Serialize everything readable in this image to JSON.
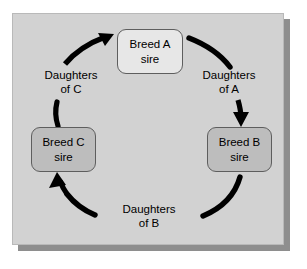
{
  "figure": {
    "panel_background": "#d2d2d2",
    "shadow_color": "#8e8e8e",
    "arrow_color": "#000000"
  },
  "nodes": [
    {
      "id": "breed-a",
      "line1": "Breed A",
      "line2": "sire",
      "fill": "#e7e7e7"
    },
    {
      "id": "breed-b",
      "line1": "Breed B",
      "line2": "sire",
      "fill": "#bdbdbd"
    },
    {
      "id": "breed-c",
      "line1": "Breed C",
      "line2": "sire",
      "fill": "#bdbdbd"
    }
  ],
  "edges": [
    {
      "id": "daughters-of-a",
      "line1": "Daughters",
      "line2": "of A",
      "from": "breed-a",
      "to": "breed-b"
    },
    {
      "id": "daughters-of-b",
      "line1": "Daughters",
      "line2": "of B",
      "from": "breed-b",
      "to": "breed-c"
    },
    {
      "id": "daughters-of-c",
      "line1": "Daughters",
      "line2": "of C",
      "from": "breed-c",
      "to": "breed-a"
    }
  ]
}
